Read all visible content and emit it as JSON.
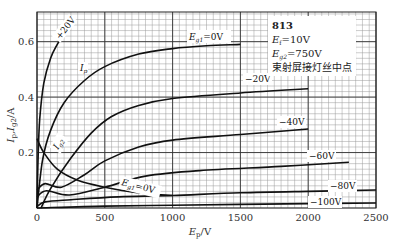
{
  "chart_data": {
    "type": "line",
    "title": "813",
    "annotation_lines": [
      "813",
      "E_f=10V",
      "E_g2=750V",
      "束射屏接灯丝中点"
    ],
    "xlabel": "E_p/V",
    "ylabel": "I_p, I_g2/A",
    "xlim": [
      0,
      2500
    ],
    "ylim": [
      0,
      0.707
    ],
    "x_ticks": [
      0,
      500,
      1000,
      1500,
      2000,
      2500
    ],
    "y_ticks": [
      0.2,
      0.4,
      0.6
    ],
    "grid": true,
    "grid_minor_x": 50,
    "grid_minor_y": 0.02,
    "series": [
      {
        "name": "+20V",
        "label": "+20V",
        "kind": "Ip",
        "points": [
          [
            0,
            0
          ],
          [
            8,
            0.18
          ],
          [
            20,
            0.32
          ],
          [
            50,
            0.45
          ],
          [
            100,
            0.54
          ],
          [
            150,
            0.59
          ],
          [
            200,
            0.63
          ],
          [
            260,
            0.665
          ]
        ]
      },
      {
        "name": "Ip (Eg1=0V)",
        "label": "E_g1=0V",
        "kind": "Ip",
        "points": [
          [
            0,
            0
          ],
          [
            40,
            0.17
          ],
          [
            100,
            0.28
          ],
          [
            200,
            0.38
          ],
          [
            350,
            0.46
          ],
          [
            500,
            0.51
          ],
          [
            750,
            0.555
          ],
          [
            1000,
            0.575
          ],
          [
            1250,
            0.585
          ],
          [
            1500,
            0.59
          ]
        ]
      },
      {
        "name": "-20V",
        "label": "-20V",
        "kind": "Ip",
        "points": [
          [
            30,
            0
          ],
          [
            100,
            0.07
          ],
          [
            250,
            0.18
          ],
          [
            400,
            0.27
          ],
          [
            550,
            0.33
          ],
          [
            750,
            0.37
          ],
          [
            1000,
            0.395
          ],
          [
            1500,
            0.415
          ],
          [
            2000,
            0.43
          ]
        ]
      },
      {
        "name": "-40V",
        "label": "-40V",
        "kind": "Ip",
        "points": [
          [
            0,
            0.065
          ],
          [
            60,
            0.088
          ],
          [
            180,
            0.075
          ],
          [
            350,
            0.12
          ],
          [
            500,
            0.17
          ],
          [
            750,
            0.22
          ],
          [
            1000,
            0.245
          ],
          [
            1500,
            0.265
          ],
          [
            2000,
            0.285
          ]
        ]
      },
      {
        "name": "-60V",
        "label": "-60V",
        "kind": "Ip",
        "points": [
          [
            0,
            0.04
          ],
          [
            70,
            0.062
          ],
          [
            240,
            0.047
          ],
          [
            500,
            0.075
          ],
          [
            800,
            0.115
          ],
          [
            1200,
            0.135
          ],
          [
            1800,
            0.15
          ],
          [
            2300,
            0.165
          ]
        ]
      },
      {
        "name": "-80V",
        "label": "-80V",
        "kind": "Ip",
        "points": [
          [
            0,
            0.005
          ],
          [
            60,
            0.022
          ],
          [
            250,
            0.03
          ],
          [
            600,
            0.04
          ],
          [
            1000,
            0.045
          ],
          [
            1500,
            0.055
          ],
          [
            2000,
            0.06
          ],
          [
            2500,
            0.065
          ]
        ]
      },
      {
        "name": "-100V",
        "label": "-100V",
        "kind": "Ip",
        "points": [
          [
            0,
            0.0
          ],
          [
            500,
            0.007
          ],
          [
            1000,
            0.01
          ],
          [
            1500,
            0.013
          ],
          [
            2000,
            0.016
          ],
          [
            2500,
            0.018
          ]
        ]
      },
      {
        "name": "Ig2 (Eg1=0V)",
        "label": "I_g2",
        "kind": "Ig2",
        "points": [
          [
            0,
            0.25
          ],
          [
            50,
            0.2
          ],
          [
            150,
            0.14
          ],
          [
            300,
            0.1
          ],
          [
            500,
            0.075
          ],
          [
            700,
            0.058
          ],
          [
            850,
            0.05
          ],
          [
            1000,
            0.045
          ]
        ]
      }
    ]
  },
  "labels": {
    "info_title": "813",
    "info_ef": "E",
    "info_ef_sub": "f",
    "info_ef_val": "=10V",
    "info_eg2": "E",
    "info_eg2_sub": "g2",
    "info_eg2_val": "=750V",
    "info_note": "束射屏接灯丝中点",
    "curve_p20": "+20V",
    "curve_ip": "I",
    "curve_ip_sub": "p",
    "curve_eg1_0": "E",
    "curve_eg1_0_sub": "g1",
    "curve_eg1_0_val": "=0V",
    "curve_m20": "−20V",
    "curve_m40": "−40V",
    "curve_m60": "−60V",
    "curve_m80": "−80V",
    "curve_m100": "−100V",
    "curve_ig2": "I",
    "curve_ig2_sub": "g2",
    "curve_ig2_eg1": "E",
    "curve_ig2_eg1_sub": "g1",
    "curve_ig2_eg1_val": "=0V",
    "x_axis": "E",
    "x_axis_sub": "p",
    "x_axis_unit": "/V",
    "y_axis": "I",
    "y_axis_sub1": "p",
    "y_axis_mid": ",I",
    "y_axis_sub2": "g2",
    "y_axis_unit": "/A"
  }
}
